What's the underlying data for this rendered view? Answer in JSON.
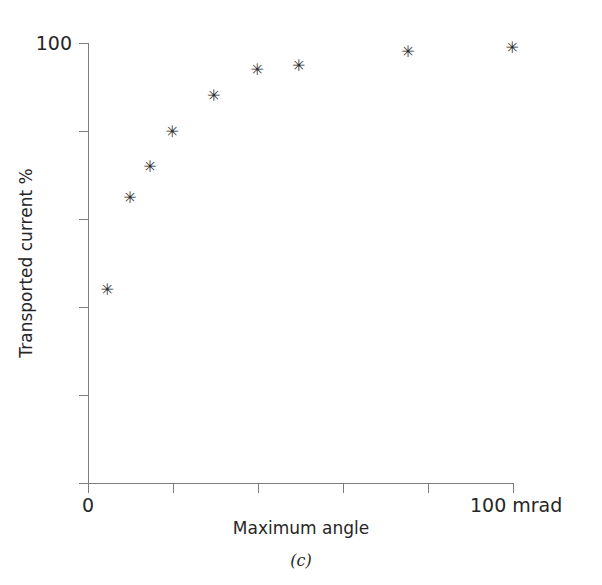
{
  "chart_data": {
    "type": "scatter",
    "title": "",
    "xlabel": "Maximum angle",
    "ylabel": "Transported current %",
    "panel_caption": "(c)",
    "xlim": [
      0,
      100
    ],
    "ylim": [
      0,
      100
    ],
    "x_unit": "mrad",
    "grid": false,
    "legend": false,
    "marker": "asterisk",
    "marker_glyph": "✳",
    "marker_color": "#2a2a2a",
    "axis_color": "#7d7d7d",
    "x_tick_values": [
      0,
      20,
      40,
      60,
      80,
      100
    ],
    "y_tick_values": [
      0,
      20,
      40,
      60,
      80,
      100
    ],
    "x_tick_labels": [
      "0",
      "",
      "",
      "",
      "",
      "100 mrad"
    ],
    "y_tick_labels": [
      "",
      "",
      "",
      "",
      "",
      "100"
    ],
    "x_axis_left_label": "0",
    "x_axis_right_label": "100 mrad",
    "y_axis_top_label": "100",
    "points": [
      {
        "x": 4.5,
        "y": 44
      },
      {
        "x": 9.9,
        "y": 65
      },
      {
        "x": 14.6,
        "y": 72
      },
      {
        "x": 19.8,
        "y": 80
      },
      {
        "x": 29.6,
        "y": 88
      },
      {
        "x": 39.8,
        "y": 94
      },
      {
        "x": 49.6,
        "y": 95
      },
      {
        "x": 75.3,
        "y": 98
      },
      {
        "x": 99.8,
        "y": 99
      }
    ],
    "x": [
      4.5,
      9.9,
      14.6,
      19.8,
      29.6,
      39.8,
      49.6,
      75.3,
      99.8
    ],
    "values": [
      44,
      65,
      72,
      80,
      88,
      94,
      95,
      98,
      99
    ]
  }
}
